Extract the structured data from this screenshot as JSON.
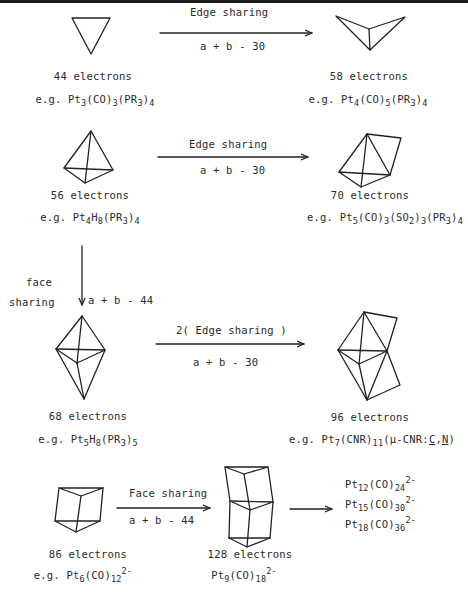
{
  "figure": {
    "type": "cluster-condensation-scheme",
    "rows": [
      {
        "left": {
          "shape": "triangle",
          "electrons": "44 electrons",
          "example": "e.g. Pt3(CO)3(PR3)4"
        },
        "arrow": {
          "top": "Edge sharing",
          "bottom": "a + b - 30"
        },
        "right": {
          "shape": "butterfly",
          "electrons": "58 electrons",
          "example": "e.g. Pt4(CO)5(PR3)4"
        }
      },
      {
        "left": {
          "shape": "tetrahedron",
          "electrons": "56 electrons",
          "example": "e.g. Pt4H8(PR3)4"
        },
        "arrow": {
          "top": "Edge sharing",
          "bottom": "a + b - 30"
        },
        "right": {
          "shape": "edge-bridged tetrahedron",
          "electrons": "70 electrons",
          "example": "e.g. Pt5(CO)3(SO2)3(PR3)4"
        }
      },
      {
        "left": {
          "shape": "trigonal bipyramid",
          "electrons": "68 electrons",
          "example": "e.g. Pt5H8(PR3)5"
        },
        "arrow": {
          "top": "2( Edge sharing )",
          "bottom": "a + b - 30"
        },
        "right": {
          "shape": "doubly edge-bridged trigonal bipyramid",
          "electrons": "96 electrons",
          "example": "e.g. Pt7(CNR)11(μ-CNR:C,N)"
        }
      },
      {
        "left": {
          "shape": "trigonal prism",
          "electrons": "86 electrons",
          "example": "e.g. Pt6(CO)12 2-"
        },
        "arrow": {
          "top": "Face sharing",
          "bottom": "a + b - 44"
        },
        "middle": {
          "shape": "face-sharing bi-prism",
          "electrons": "128 electrons",
          "example": "Pt9(CO)18 2-"
        },
        "right": {
          "list": [
            "Pt12(CO)24 2-",
            "Pt15(CO)30 2-",
            "Pt18(CO)36 2-"
          ]
        }
      }
    ],
    "vertical_arrow": {
      "side_label_1": "face",
      "side_label_2": "sharing",
      "formula": "a + b - 44"
    }
  },
  "labels": {
    "r1_arrow_top": "Edge sharing",
    "r1_arrow_bottom": "a + b - 30",
    "r1_left_electrons": "44 electrons",
    "r1_right_electrons": "58 electrons",
    "r2_arrow_top": "Edge sharing",
    "r2_arrow_bottom": "a + b - 30",
    "r2_left_electrons": "56 electrons",
    "r2_right_electrons": "70 electrons",
    "v_face": "face",
    "v_sharing": "sharing",
    "v_formula": "a + b - 44",
    "r3_arrow_top": "2( Edge sharing )",
    "r3_arrow_bottom": "a + b - 30",
    "r3_left_electrons": "68 electrons",
    "r3_right_electrons": "96 electrons",
    "r4_arrow_top": "Face sharing",
    "r4_arrow_bottom": "a + b - 44",
    "r4_left_electrons": "86 electrons",
    "r4_mid_electrons": "128 electrons",
    "eg": "e.g.",
    "Pt": "Pt",
    "CO": "(CO)",
    "PR": "(PR",
    "close": ")",
    "H": "H",
    "SO": "(SO",
    "CNR": "(CNR)",
    "mu": "(μ-CNR:",
    "C": "C",
    "comma": ",",
    "N": "N",
    "charge": "2-",
    "n1": "1",
    "n2": "2",
    "n3": "3",
    "n4": "4",
    "n5": "5",
    "n6": "6",
    "n7": "7",
    "n8": "8",
    "n9": "9",
    "n11": "11",
    "n12": "12",
    "n15": "15",
    "n18": "18",
    "n24": "24",
    "n30": "30",
    "n36": "36"
  }
}
